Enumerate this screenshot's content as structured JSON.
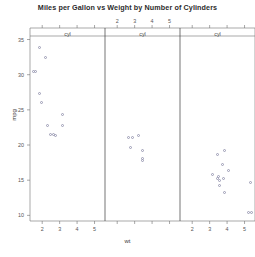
{
  "chart_data": {
    "type": "scatter",
    "title": "Miles per Gallon vs Weight by Number of Cylinders",
    "xlabel": "wt",
    "ylabel": "mpg",
    "xlim": [
      1.3,
      5.6
    ],
    "ylim": [
      9.2,
      35.5
    ],
    "grid": false,
    "legend": "none",
    "conditioning_variable": "cyl",
    "panel_strip_labels": [
      "cyl",
      "cyl",
      "cyl"
    ],
    "strip_tick_labels": [
      "2",
      "3",
      "4",
      "5"
    ],
    "xticks": [
      2,
      3,
      4,
      5
    ],
    "xtick_labels": [
      "2",
      "3",
      "4",
      "5"
    ],
    "yticks": [
      10,
      15,
      20,
      25,
      30,
      35
    ],
    "ytick_labels": [
      "10",
      "15",
      "20",
      "25",
      "30",
      "35"
    ],
    "panels": [
      {
        "name": "cyl-4",
        "label": "cyl",
        "points": [
          {
            "x": 1.835,
            "y": 33.9
          },
          {
            "x": 1.615,
            "y": 30.4
          },
          {
            "x": 1.513,
            "y": 30.4
          },
          {
            "x": 2.2,
            "y": 32.4
          },
          {
            "x": 1.835,
            "y": 27.3
          },
          {
            "x": 1.935,
            "y": 26.0
          },
          {
            "x": 2.32,
            "y": 22.8
          },
          {
            "x": 2.78,
            "y": 21.4
          },
          {
            "x": 3.15,
            "y": 22.8
          },
          {
            "x": 3.19,
            "y": 24.4
          },
          {
            "x": 2.465,
            "y": 21.5
          },
          {
            "x": 2.62,
            "y": 21.5
          }
        ]
      },
      {
        "name": "cyl-6",
        "label": "cyl",
        "points": [
          {
            "x": 2.62,
            "y": 21.0
          },
          {
            "x": 2.875,
            "y": 21.0
          },
          {
            "x": 3.215,
            "y": 21.4
          },
          {
            "x": 3.44,
            "y": 19.2
          },
          {
            "x": 3.46,
            "y": 17.8
          },
          {
            "x": 2.77,
            "y": 19.7
          },
          {
            "x": 3.44,
            "y": 18.1
          }
        ]
      },
      {
        "name": "cyl-8",
        "label": "cyl",
        "points": [
          {
            "x": 3.44,
            "y": 18.7
          },
          {
            "x": 3.57,
            "y": 14.3
          },
          {
            "x": 4.07,
            "y": 16.4
          },
          {
            "x": 3.73,
            "y": 17.3
          },
          {
            "x": 3.78,
            "y": 15.2
          },
          {
            "x": 5.25,
            "y": 10.4
          },
          {
            "x": 5.424,
            "y": 10.4
          },
          {
            "x": 5.345,
            "y": 14.7
          },
          {
            "x": 3.52,
            "y": 15.5
          },
          {
            "x": 3.435,
            "y": 15.2
          },
          {
            "x": 3.84,
            "y": 13.3
          },
          {
            "x": 3.845,
            "y": 19.2
          },
          {
            "x": 3.17,
            "y": 15.8
          },
          {
            "x": 3.57,
            "y": 15.0
          }
        ]
      }
    ]
  }
}
